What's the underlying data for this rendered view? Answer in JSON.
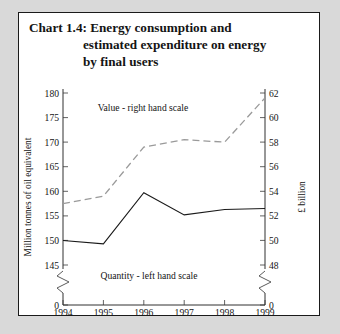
{
  "chart_data": {
    "type": "line",
    "title": "Chart 1.4: Energy consumption and estimated expenditure on energy by final users",
    "title_lines": [
      "Chart 1.4: Energy consumption and",
      "estimated expenditure on energy",
      "by final users"
    ],
    "x": [
      1994,
      1995,
      1996,
      1997,
      1998,
      1999
    ],
    "xlabel": "",
    "xtick_labels": [
      "1994",
      "1995",
      "1996",
      "1997",
      "1998",
      "1999"
    ],
    "ylabel_left": "Million tonnes of oil equivalent",
    "ylabel_right": "£ billion",
    "ylim_left": [
      145,
      180
    ],
    "ylim_right": [
      48,
      62
    ],
    "ytick_left": [
      145,
      150,
      155,
      160,
      165,
      170,
      175,
      180
    ],
    "ytick_left_labels": [
      "145",
      "150",
      "155",
      "160",
      "165",
      "170",
      "175",
      "180"
    ],
    "ytick_right": [
      48,
      50,
      52,
      54,
      56,
      58,
      60,
      62
    ],
    "ytick_right_labels": [
      "48",
      "50",
      "52",
      "54",
      "56",
      "58",
      "60",
      "62"
    ],
    "zero_label_left": "0",
    "zero_label_right": "0",
    "axis_break": true,
    "grid": false,
    "legend_position": "inline-annotations",
    "series": [
      {
        "name": "Quantity - left hand scale",
        "axis": "left",
        "style": "solid",
        "color": "#1a1a1a",
        "values": [
          150.0,
          149.3,
          159.7,
          155.2,
          156.3,
          156.5
        ]
      },
      {
        "name": "Value - right hand scale",
        "axis": "right",
        "style": "dashed",
        "color": "#9a9a9a",
        "values": [
          53.0,
          53.6,
          57.6,
          58.2,
          58.0,
          61.6
        ]
      }
    ],
    "annotations": [
      {
        "text": "Value - right hand scale",
        "x": 1996.0,
        "y": 60.6,
        "axis": "right"
      },
      {
        "text": "Quantity - left hand scale",
        "x": 1996.1,
        "y": 147.9,
        "axis": "left"
      }
    ]
  }
}
